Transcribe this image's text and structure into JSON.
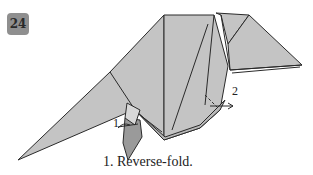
{
  "step": {
    "number": "24"
  },
  "labels": {
    "one": "1",
    "two": "2"
  },
  "caption": "1. Reverse-fold.",
  "colors": {
    "paper": "#c4c4c4",
    "paper_dark": "#9a9a9a",
    "line": "#2a2a2a",
    "badge": "#8f8f8f"
  }
}
